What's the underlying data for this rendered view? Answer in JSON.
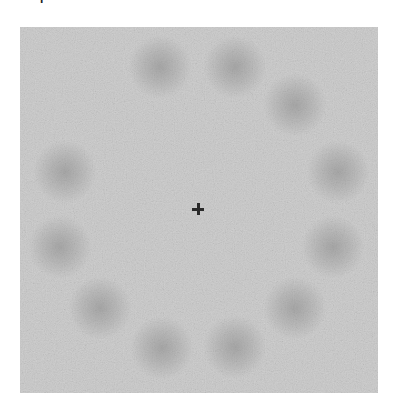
{
  "corner_label": "l",
  "stimulus": {
    "background_color": "#c9c9c9",
    "blob_color": "#a8a8a8",
    "fixation_color": "#2a2a2a",
    "fixation": {
      "x": 198,
      "y": 209
    },
    "blobs": [
      {
        "x": 160,
        "y": 67
      },
      {
        "x": 235,
        "y": 67
      },
      {
        "x": 295,
        "y": 105
      },
      {
        "x": 338,
        "y": 172
      },
      {
        "x": 333,
        "y": 247
      },
      {
        "x": 295,
        "y": 308
      },
      {
        "x": 235,
        "y": 347
      },
      {
        "x": 162,
        "y": 348
      },
      {
        "x": 100,
        "y": 308
      },
      {
        "x": 60,
        "y": 247
      },
      {
        "x": 65,
        "y": 172
      }
    ],
    "blob_count": 11,
    "missing_position": "upper-left"
  }
}
